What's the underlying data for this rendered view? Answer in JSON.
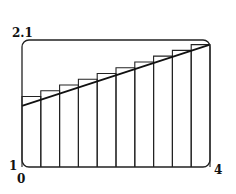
{
  "chart_data": {
    "type": "bar",
    "subtype": "riemann-sum-right-endpoints-with-curve",
    "title": "",
    "xlabel": "",
    "ylabel": "",
    "xlim": [
      0,
      4
    ],
    "ylim": [
      1,
      2.1
    ],
    "grid": false,
    "legend": null,
    "x_tick_labels": {
      "left": "0",
      "right": "4"
    },
    "y_tick_labels": {
      "bottom": "1",
      "top": "2.1"
    },
    "num_rectangles": 10,
    "rect_width": 0.4,
    "x_left_edges": [
      0,
      0.4,
      0.8,
      1.2,
      1.6,
      2.0,
      2.4,
      2.8,
      3.2,
      3.6
    ],
    "values": [
      1.61,
      1.66,
      1.71,
      1.76,
      1.81,
      1.86,
      1.91,
      1.96,
      2.01,
      2.06
    ],
    "curve": {
      "description": "increasing curve drawn over rectangles",
      "x": [
        0,
        4
      ],
      "y": [
        1.53,
        2.06
      ]
    }
  },
  "labels": {
    "y_top": "2.1",
    "y_bottom": "1",
    "x_left": "0",
    "x_right": "4"
  }
}
